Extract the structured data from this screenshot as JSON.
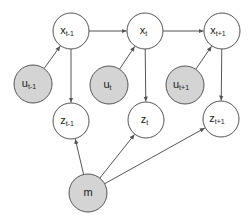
{
  "diagram": {
    "type": "graphical-model",
    "colors": {
      "observed_fill": "#d4d4d4",
      "latent_fill": "#ffffff",
      "stroke": "#555555",
      "edge": "#555555"
    },
    "nodes": [
      {
        "id": "x_t-1",
        "base": "x",
        "sub": "t-1",
        "cx": 71,
        "cy": 31,
        "r": 18,
        "shaded": false
      },
      {
        "id": "x_t",
        "base": "x",
        "sub": "t",
        "cx": 145,
        "cy": 31,
        "r": 18,
        "shaded": false
      },
      {
        "id": "x_t+1",
        "base": "x",
        "sub": "t+1",
        "cx": 222,
        "cy": 31,
        "r": 18,
        "shaded": false
      },
      {
        "id": "u_t-1",
        "base": "u",
        "sub": "t-1",
        "cx": 33,
        "cy": 84,
        "r": 19,
        "shaded": true
      },
      {
        "id": "u_t",
        "base": "u",
        "sub": "t",
        "cx": 109,
        "cy": 85,
        "r": 19,
        "shaded": true
      },
      {
        "id": "u_t+1",
        "base": "u",
        "sub": "t+1",
        "cx": 185,
        "cy": 85,
        "r": 19,
        "shaded": true
      },
      {
        "id": "z_t-1",
        "base": "z",
        "sub": "t-1",
        "cx": 71,
        "cy": 121,
        "r": 18,
        "shaded": false
      },
      {
        "id": "z_t",
        "base": "z",
        "sub": "t",
        "cx": 146,
        "cy": 120,
        "r": 18,
        "shaded": false
      },
      {
        "id": "z_t+1",
        "base": "z",
        "sub": "t+1",
        "cx": 221,
        "cy": 119,
        "r": 18,
        "shaded": false
      },
      {
        "id": "m",
        "base": "m",
        "sub": "",
        "cx": 88,
        "cy": 193,
        "r": 19,
        "shaded": true
      }
    ],
    "edges": [
      {
        "from": "x_t-1",
        "to": "x_t"
      },
      {
        "from": "x_t",
        "to": "x_t+1"
      },
      {
        "from": "u_t-1",
        "to": "x_t-1"
      },
      {
        "from": "u_t",
        "to": "x_t"
      },
      {
        "from": "u_t+1",
        "to": "x_t+1"
      },
      {
        "from": "x_t-1",
        "to": "z_t-1"
      },
      {
        "from": "x_t",
        "to": "z_t"
      },
      {
        "from": "x_t+1",
        "to": "z_t+1"
      },
      {
        "from": "m",
        "to": "z_t-1"
      },
      {
        "from": "m",
        "to": "z_t"
      },
      {
        "from": "m",
        "to": "z_t+1"
      }
    ]
  }
}
